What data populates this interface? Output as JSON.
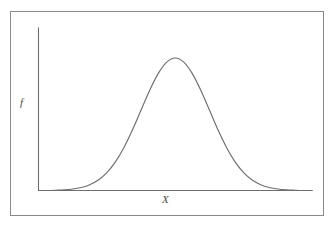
{
  "figure": {
    "frame_border_color": "#8a8a8a",
    "background_color": "#ffffff",
    "curve_color": "#6e6e6e",
    "axis_color": "#6e6e6e"
  },
  "axes": {
    "y_label": "f",
    "x_label": "X"
  },
  "chart_data": {
    "type": "line",
    "title": "",
    "subtitle": "",
    "xlabel": "X",
    "ylabel": "f",
    "grid": false,
    "legend": null,
    "annotations": [],
    "xtick_labels": [],
    "ytick_labels": [],
    "xlim": [
      -4,
      4
    ],
    "ylim": [
      0,
      1.05
    ],
    "distribution": {
      "name": "normal",
      "mean": 0,
      "std_dev": 1,
      "peak_height": 1.0
    },
    "series": [
      {
        "name": "normal probability density",
        "x": [
          -4.0,
          -3.75,
          -3.5,
          -3.25,
          -3.0,
          -2.75,
          -2.5,
          -2.25,
          -2.0,
          -1.75,
          -1.5,
          -1.25,
          -1.0,
          -0.75,
          -0.5,
          -0.25,
          0.0,
          0.25,
          0.5,
          0.75,
          1.0,
          1.25,
          1.5,
          1.75,
          2.0,
          2.25,
          2.5,
          2.75,
          3.0,
          3.25,
          3.5,
          3.75,
          4.0
        ],
        "values": [
          0.0,
          0.0,
          0.002,
          0.005,
          0.011,
          0.023,
          0.044,
          0.079,
          0.135,
          0.216,
          0.325,
          0.458,
          0.607,
          0.755,
          0.882,
          0.969,
          1.0,
          0.969,
          0.882,
          0.755,
          0.607,
          0.458,
          0.325,
          0.216,
          0.135,
          0.079,
          0.044,
          0.023,
          0.011,
          0.005,
          0.002,
          0.0,
          0.0
        ]
      }
    ]
  }
}
